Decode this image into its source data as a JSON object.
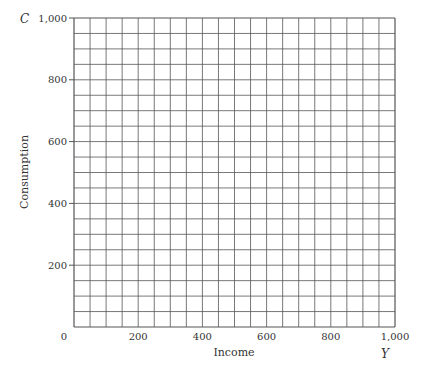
{
  "chart_data": {
    "type": "line",
    "title": "",
    "xlabel": "Income",
    "ylabel": "Consumption",
    "x_variable": "Y",
    "y_variable": "C",
    "xlim": [
      0,
      1000
    ],
    "ylim": [
      0,
      1000
    ],
    "x_ticks": [
      "0",
      "200",
      "400",
      "600",
      "800",
      "1,000"
    ],
    "y_ticks": [
      "200",
      "400",
      "600",
      "800",
      "1,000"
    ],
    "grid": true,
    "grid_divisions": 20,
    "series": []
  },
  "colors": {
    "grid": "#555555",
    "text": "#333333"
  }
}
